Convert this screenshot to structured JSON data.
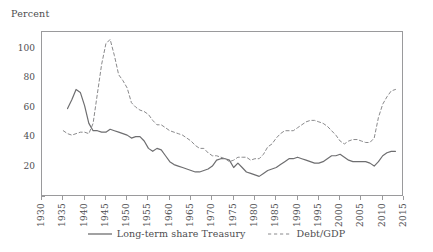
{
  "chart_data": {
    "type": "line",
    "title": "",
    "ylabel": "Percent",
    "xlabel": "",
    "ylim": [
      0,
      112
    ],
    "xlim": [
      1930,
      2015
    ],
    "grid": false,
    "legend_position": "bottom-center",
    "y_ticks": [
      0,
      20,
      40,
      60,
      80,
      100
    ],
    "y_tick_labels": [
      "",
      "20",
      "40",
      "60",
      "80",
      "100"
    ],
    "x_ticks": [
      1930,
      1935,
      1940,
      1945,
      1950,
      1955,
      1960,
      1965,
      1970,
      1975,
      1980,
      1985,
      1990,
      1995,
      2000,
      2005,
      2010,
      2015
    ],
    "x_tick_labels": [
      "1930",
      "1935",
      "1940",
      "1945",
      "1950",
      "1955",
      "1960",
      "1965",
      "1970",
      "1975",
      "1980",
      "1985",
      "1990",
      "1995",
      "2000",
      "2005",
      "2010",
      "2015"
    ],
    "series": [
      {
        "name": "Long-term share Treasury",
        "style": "solid",
        "color": "#6e6e70",
        "x": [
          1936,
          1937,
          1938,
          1939,
          1940,
          1941,
          1942,
          1943,
          1944,
          1945,
          1946,
          1947,
          1948,
          1949,
          1950,
          1951,
          1952,
          1953,
          1954,
          1955,
          1956,
          1957,
          1958,
          1959,
          1960,
          1961,
          1962,
          1963,
          1964,
          1965,
          1966,
          1967,
          1968,
          1969,
          1970,
          1971,
          1972,
          1973,
          1974,
          1975,
          1976,
          1977,
          1978,
          1979,
          1980,
          1981,
          1982,
          1983,
          1984,
          1985,
          1986,
          1987,
          1988,
          1989,
          1990,
          1991,
          1992,
          1993,
          1994,
          1995,
          1996,
          1997,
          1998,
          1999,
          2000,
          2001,
          2002,
          2003,
          2004,
          2005,
          2006,
          2007,
          2008,
          2009,
          2010,
          2011,
          2012,
          2013
        ],
        "y": [
          60,
          66,
          73,
          71,
          62,
          50,
          45,
          45,
          44,
          44,
          46,
          45,
          44,
          43,
          42,
          40,
          41,
          41,
          38,
          33,
          31,
          33,
          32,
          28,
          24,
          22,
          21,
          20,
          19,
          18,
          17,
          17,
          18,
          19,
          21,
          25,
          26,
          26,
          25,
          20,
          23,
          20,
          17,
          16,
          15,
          14,
          16,
          18,
          19,
          20,
          22,
          24,
          26,
          26,
          27,
          26,
          25,
          24,
          23,
          23,
          24,
          26,
          28,
          28,
          29,
          27,
          25,
          24,
          24,
          24,
          24,
          23,
          21,
          24,
          28,
          30,
          31,
          31
        ]
      },
      {
        "name": "Debt/GDP",
        "style": "dashed",
        "color": "#8a8a8c",
        "x": [
          1935,
          1936,
          1937,
          1938,
          1939,
          1940,
          1941,
          1942,
          1943,
          1944,
          1945,
          1946,
          1947,
          1948,
          1949,
          1950,
          1951,
          1952,
          1953,
          1954,
          1955,
          1956,
          1957,
          1958,
          1959,
          1960,
          1961,
          1962,
          1963,
          1964,
          1965,
          1966,
          1967,
          1968,
          1969,
          1970,
          1971,
          1972,
          1973,
          1974,
          1975,
          1976,
          1977,
          1978,
          1979,
          1980,
          1981,
          1982,
          1983,
          1984,
          1985,
          1986,
          1987,
          1988,
          1989,
          1990,
          1991,
          1992,
          1993,
          1994,
          1995,
          1996,
          1997,
          1998,
          1999,
          2000,
          2001,
          2002,
          2003,
          2004,
          2005,
          2006,
          2007,
          2008,
          2009,
          2010,
          2011,
          2012,
          2013
        ],
        "y": [
          45,
          43,
          42,
          43,
          44,
          44,
          43,
          50,
          70,
          90,
          104,
          107,
          96,
          83,
          79,
          74,
          64,
          61,
          59,
          58,
          56,
          52,
          49,
          49,
          47,
          45,
          44,
          43,
          42,
          40,
          38,
          35,
          33,
          33,
          30,
          28,
          28,
          27,
          26,
          24,
          25,
          27,
          27,
          27,
          25,
          26,
          26,
          29,
          34,
          36,
          40,
          43,
          45,
          45,
          45,
          47,
          49,
          51,
          52,
          52,
          51,
          50,
          48,
          45,
          42,
          38,
          36,
          38,
          39,
          39,
          38,
          37,
          37,
          40,
          54,
          63,
          68,
          72,
          73
        ]
      }
    ]
  },
  "legend": {
    "entries": [
      {
        "label": "Long-term share Treasury",
        "style": "solid"
      },
      {
        "label": "Debt/GDP",
        "style": "dashed"
      }
    ]
  }
}
